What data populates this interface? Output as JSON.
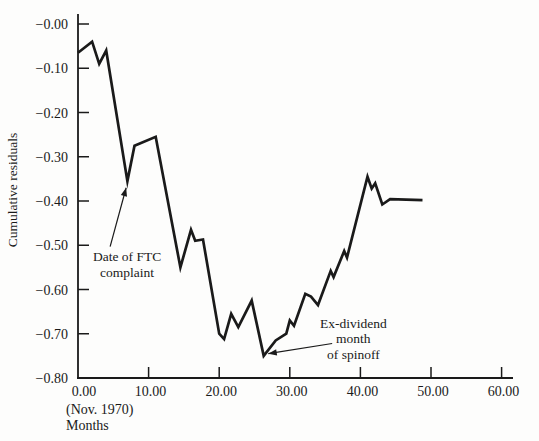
{
  "chart_data": {
    "type": "line",
    "title": "",
    "ylabel": "Cumulative residuals",
    "xlabel": "Months",
    "x_sub_label": "(Nov. 1970)",
    "xlim": [
      0,
      60
    ],
    "ylim": [
      -0.8,
      0.0
    ],
    "grid": false,
    "legend": "none",
    "line_color": "#1a1a1a",
    "x_ticks": [
      {
        "value": 0,
        "label": "0.00"
      },
      {
        "value": 10,
        "label": "10.00"
      },
      {
        "value": 20,
        "label": "20.00"
      },
      {
        "value": 30,
        "label": "30.00"
      },
      {
        "value": 40,
        "label": "40.00"
      },
      {
        "value": 50,
        "label": "50.00"
      },
      {
        "value": 60,
        "label": "60.00"
      }
    ],
    "y_ticks": [
      {
        "value": -0.0,
        "label": "−0.00"
      },
      {
        "value": -0.1,
        "label": "−0.10"
      },
      {
        "value": -0.2,
        "label": "−0.20"
      },
      {
        "value": -0.3,
        "label": "−0.30"
      },
      {
        "value": -0.4,
        "label": "−0.40"
      },
      {
        "value": -0.5,
        "label": "−0.50"
      },
      {
        "value": -0.6,
        "label": "−0.60"
      },
      {
        "value": -0.7,
        "label": "−0.70"
      },
      {
        "value": -0.8,
        "label": "−0.80"
      }
    ],
    "series": [
      {
        "name": "cumulative-residuals",
        "points": [
          [
            0,
            -0.065
          ],
          [
            2,
            -0.04
          ],
          [
            3,
            -0.09
          ],
          [
            4,
            -0.06
          ],
          [
            7,
            -0.355
          ],
          [
            8,
            -0.275
          ],
          [
            11,
            -0.255
          ],
          [
            14.5,
            -0.55
          ],
          [
            16,
            -0.465
          ],
          [
            16.6,
            -0.49
          ],
          [
            17.7,
            -0.487
          ],
          [
            20,
            -0.7
          ],
          [
            20.7,
            -0.712
          ],
          [
            21.7,
            -0.655
          ],
          [
            22.7,
            -0.685
          ],
          [
            24.6,
            -0.625
          ],
          [
            26.3,
            -0.75
          ],
          [
            28,
            -0.715
          ],
          [
            29.5,
            -0.7
          ],
          [
            30,
            -0.67
          ],
          [
            30.6,
            -0.682
          ],
          [
            32.2,
            -0.61
          ],
          [
            33,
            -0.616
          ],
          [
            34,
            -0.635
          ],
          [
            35.8,
            -0.558
          ],
          [
            36.2,
            -0.572
          ],
          [
            37.7,
            -0.513
          ],
          [
            38.1,
            -0.528
          ],
          [
            41,
            -0.345
          ],
          [
            41.6,
            -0.372
          ],
          [
            42.1,
            -0.36
          ],
          [
            43.1,
            -0.408
          ],
          [
            44.2,
            -0.396
          ],
          [
            48.8,
            -0.398
          ]
        ]
      }
    ],
    "annotations": [
      {
        "id": "ftc-complaint",
        "lines": [
          "Date of FTC",
          "complaint"
        ],
        "text_anchor": {
          "month": 6.95,
          "value": -0.536
        },
        "arrow": {
          "path": [
            [
              4.55,
              -0.503
            ],
            [
              6.82,
              -0.37
            ]
          ]
        }
      },
      {
        "id": "spinoff",
        "lines": [
          "Ex-dividend",
          "month",
          "of spinoff"
        ],
        "text_anchor": {
          "month": 39.0,
          "value": -0.687
        },
        "arrow": {
          "path": [
            [
              36.0,
              -0.722
            ],
            [
              26.95,
              -0.745
            ]
          ]
        }
      }
    ]
  }
}
